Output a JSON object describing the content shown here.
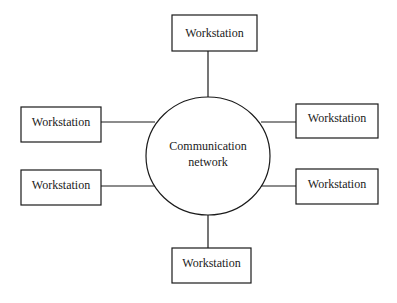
{
  "diagram": {
    "type": "star-network",
    "hub": {
      "id": "hub",
      "label_lines": [
        "Communication",
        "network"
      ]
    },
    "nodes": [
      {
        "id": "ws-top",
        "label": "Workstation",
        "position": "top"
      },
      {
        "id": "ws-left-upper",
        "label": "Workstation",
        "position": "left-upper"
      },
      {
        "id": "ws-right-upper",
        "label": "Workstation",
        "position": "right-upper"
      },
      {
        "id": "ws-left-lower",
        "label": "Workstation",
        "position": "left-lower"
      },
      {
        "id": "ws-right-lower",
        "label": "Workstation",
        "position": "right-lower"
      },
      {
        "id": "ws-bottom",
        "label": "Workstation",
        "position": "bottom"
      }
    ],
    "edges": [
      {
        "from": "ws-top",
        "to": "hub"
      },
      {
        "from": "ws-left-upper",
        "to": "hub"
      },
      {
        "from": "ws-right-upper",
        "to": "hub"
      },
      {
        "from": "ws-left-lower",
        "to": "hub"
      },
      {
        "from": "ws-right-lower",
        "to": "hub"
      },
      {
        "from": "ws-bottom",
        "to": "hub"
      }
    ]
  }
}
